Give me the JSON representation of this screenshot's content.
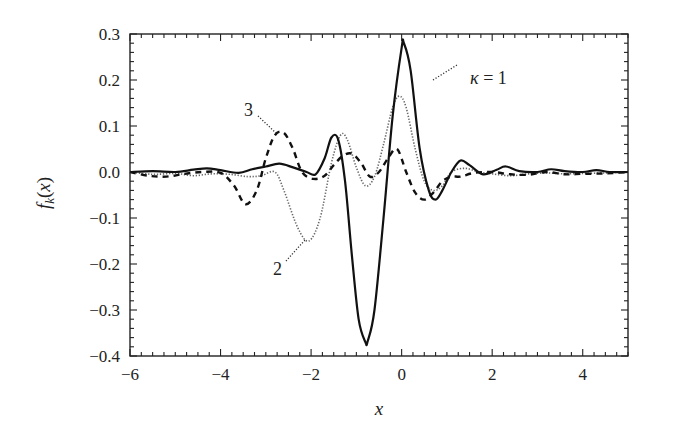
{
  "chart_data": {
    "type": "line",
    "title": "",
    "note": "Curve points are approximate values read by eye from the screenshot; the generating function is unknown.",
    "xlabel": "x",
    "ylabel": "f_k(x)",
    "xlim": [
      -6,
      5
    ],
    "ylim": [
      -0.4,
      0.3
    ],
    "xticks": [
      -6,
      -4,
      -2,
      0,
      2,
      4
    ],
    "xtick_labels": [
      "−6",
      "−4",
      "−2",
      "0",
      "2",
      "4"
    ],
    "yticks": [
      0.3,
      0.2,
      0.1,
      0.0,
      -0.1,
      -0.2,
      -0.3,
      -0.4
    ],
    "ytick_labels": [
      "0.3",
      "0.2",
      "0.1",
      "0.0",
      "−0.1",
      "−0.2",
      "−0.3",
      "−0.4"
    ],
    "grid": false,
    "legend": "inline annotations",
    "series": [
      {
        "name": "κ = 1",
        "style": "solid",
        "x": [
          -6,
          -5.5,
          -5,
          -4.6,
          -4.3,
          -4,
          -3.6,
          -3.3,
          -3,
          -2.7,
          -2.4,
          -2.1,
          -1.9,
          -1.7,
          -1.55,
          -1.4,
          -1.25,
          -1.1,
          -0.95,
          -0.8,
          -0.75,
          -0.6,
          -0.4,
          -0.2,
          0,
          0.05,
          0.2,
          0.4,
          0.6,
          0.75,
          0.9,
          1.1,
          1.3,
          1.5,
          1.8,
          2.1,
          2.3,
          2.6,
          3,
          3.3,
          3.6,
          4,
          4.3,
          4.6,
          5
        ],
        "y": [
          0.0,
          0.002,
          0.0,
          0.005,
          0.008,
          0.004,
          -0.002,
          0.006,
          0.012,
          0.018,
          0.01,
          0.0,
          -0.005,
          0.03,
          0.075,
          0.07,
          -0.02,
          -0.18,
          -0.32,
          -0.37,
          -0.368,
          -0.3,
          -0.1,
          0.12,
          0.27,
          0.28,
          0.22,
          0.05,
          -0.04,
          -0.06,
          -0.04,
          0.0,
          0.025,
          0.015,
          -0.005,
          0.005,
          0.012,
          0.002,
          0.0,
          0.006,
          0.002,
          0.0,
          0.004,
          0.0,
          0.0
        ]
      },
      {
        "name": "2",
        "style": "dotted",
        "x": [
          -6,
          -5.5,
          -5,
          -4.6,
          -4.2,
          -3.8,
          -3.4,
          -3.1,
          -2.8,
          -2.6,
          -2.3,
          -2.05,
          -1.8,
          -1.55,
          -1.35,
          -1.2,
          -1.0,
          -0.8,
          -0.6,
          -0.4,
          -0.2,
          -0.05,
          0.1,
          0.3,
          0.5,
          0.7,
          0.9,
          1.1,
          1.4,
          1.7,
          2.0,
          2.4,
          2.8,
          3.2,
          3.6,
          4.0,
          4.5,
          5
        ],
        "y": [
          0.0,
          -0.005,
          -0.003,
          -0.008,
          -0.004,
          -0.005,
          -0.01,
          -0.008,
          0.0,
          -0.04,
          -0.12,
          -0.15,
          -0.1,
          0.02,
          0.08,
          0.07,
          0.01,
          -0.03,
          -0.01,
          0.06,
          0.14,
          0.165,
          0.14,
          0.05,
          -0.02,
          -0.04,
          -0.03,
          0.0,
          0.008,
          0.0,
          -0.004,
          -0.008,
          -0.004,
          -0.002,
          -0.004,
          -0.003,
          -0.002,
          0.0
        ]
      },
      {
        "name": "3",
        "style": "dashed",
        "x": [
          -6,
          -5.6,
          -5.2,
          -4.8,
          -4.4,
          -4.0,
          -3.7,
          -3.45,
          -3.2,
          -3.0,
          -2.8,
          -2.6,
          -2.4,
          -2.2,
          -1.95,
          -1.7,
          -1.5,
          -1.3,
          -1.1,
          -0.9,
          -0.7,
          -0.5,
          -0.3,
          -0.1,
          0.1,
          0.3,
          0.5,
          0.7,
          0.9,
          1.1,
          1.3,
          1.6,
          2.0,
          2.4,
          2.8,
          3.2,
          3.6,
          4.0,
          4.5,
          5
        ],
        "y": [
          0.0,
          -0.008,
          -0.01,
          -0.004,
          0.0,
          -0.002,
          -0.03,
          -0.07,
          -0.04,
          0.03,
          0.08,
          0.085,
          0.05,
          0.0,
          -0.015,
          -0.008,
          0.015,
          0.035,
          0.04,
          0.02,
          -0.01,
          0.0,
          0.03,
          0.05,
          0.0,
          -0.045,
          -0.06,
          -0.045,
          -0.02,
          -0.01,
          -0.01,
          -0.002,
          0.0,
          -0.005,
          -0.006,
          0.0,
          -0.005,
          -0.004,
          -0.003,
          0.0
        ]
      }
    ],
    "annotations": [
      {
        "text": "κ = 1",
        "near_x": 0.2,
        "near_y": 0.22
      },
      {
        "text": "2",
        "near_x": -2.0,
        "near_y": -0.16
      },
      {
        "text": "3",
        "near_x": -2.6,
        "near_y": 0.085
      }
    ]
  }
}
